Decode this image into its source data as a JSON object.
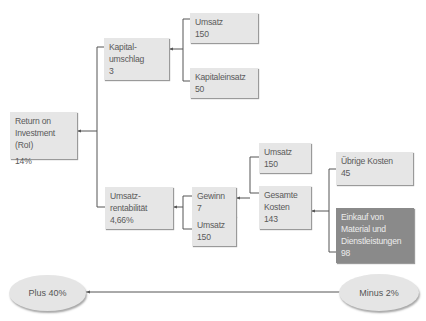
{
  "diagram": {
    "nodes": {
      "roi": {
        "label_1": "Return on",
        "label_2": "Investment (RoI)",
        "value": "14%"
      },
      "kapitalumschlag": {
        "label_1": "Kapital-",
        "label_2": "umschlag",
        "value": "3"
      },
      "umsatz_top": {
        "label": "Umsatz",
        "value": "150"
      },
      "kapitaleinsatz": {
        "label": "Kapitaleinsatz",
        "value": "50"
      },
      "umsatzrentabilitaet": {
        "label_1": "Umsatz-",
        "label_2": "rentabilität",
        "value": "4,66%"
      },
      "gewinn": {
        "label": "Gewinn",
        "value": "7"
      },
      "umsatz_mid": {
        "label": "Umsatz",
        "value": "150"
      },
      "umsatz_right": {
        "label": "Umsatz",
        "value": "150"
      },
      "gesamte_kosten": {
        "label_1": "Gesamte",
        "label_2": "Kosten",
        "value": "143"
      },
      "uebrige_kosten": {
        "label": "Übrige Kosten",
        "value": "45"
      },
      "einkauf": {
        "label_1": "Einkauf von",
        "label_2": "Material und",
        "label_3": "Dienstleistungen",
        "value": "98"
      }
    },
    "ellipses": {
      "left": {
        "label": "Plus 40%"
      },
      "right": {
        "label": "Minus 2%"
      }
    },
    "colors": {
      "box": "#e6e6e6",
      "box_highlight": "#8a8a8a",
      "line": "#555555",
      "text": "#5a5a5a"
    }
  }
}
